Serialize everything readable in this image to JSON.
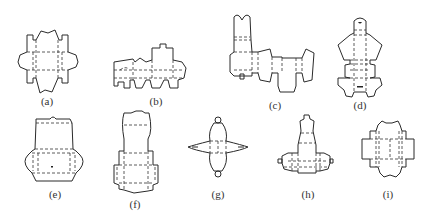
{
  "figure": {
    "panels": [
      {
        "id": "a",
        "label": "(a)"
      },
      {
        "id": "b",
        "label": "(b)"
      },
      {
        "id": "c",
        "label": "(c)"
      },
      {
        "id": "d",
        "label": "(d)"
      },
      {
        "id": "e",
        "label": "(e)"
      },
      {
        "id": "f",
        "label": "(f)"
      },
      {
        "id": "g",
        "label": "(g)"
      },
      {
        "id": "h",
        "label": "(h)"
      },
      {
        "id": "i",
        "label": "(i)"
      }
    ]
  },
  "colors": {
    "line": "#2a2a2a",
    "background": "#ffffff"
  }
}
